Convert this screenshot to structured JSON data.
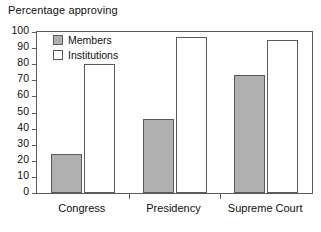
{
  "chart_data": {
    "type": "bar",
    "title": "Percentage approving",
    "xlabel": "",
    "ylabel": "",
    "ylim": [
      0,
      100
    ],
    "ytick_step": 10,
    "yticks": [
      100,
      90,
      80,
      70,
      60,
      50,
      40,
      30,
      20,
      10,
      0
    ],
    "grid": false,
    "legend_position": "top-left-inside",
    "categories": [
      "Congress",
      "Presidency",
      "Supreme Court"
    ],
    "series": [
      {
        "name": "Members",
        "values": [
          24,
          46,
          73
        ],
        "color": "#b0b0b0"
      },
      {
        "name": "Institutions",
        "values": [
          80,
          97,
          95
        ],
        "color": "#ffffff"
      }
    ]
  },
  "legend": {
    "items": [
      {
        "label": "Members",
        "swatch": "members"
      },
      {
        "label": "Institutions",
        "swatch": "institutions"
      }
    ]
  },
  "colors": {
    "members_fill": "#b0b0b0",
    "institutions_fill": "#ffffff",
    "axis": "#5a5a5a",
    "text": "#111111",
    "background": "#ffffff"
  }
}
